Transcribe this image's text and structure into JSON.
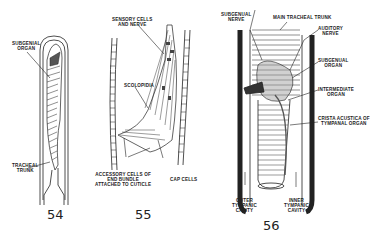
{
  "figures": [
    {
      "number": "54",
      "labels": {
        "subgenual_organ_1": "SUBGENIAL",
        "subgenual_organ_2": "ORGAN",
        "tracheal_trunk_1": "TRACHEAL",
        "tracheal_trunk_2": "TRUNK"
      }
    },
    {
      "number": "55",
      "labels": {
        "sensory_1": "SENSORY CELLS",
        "sensory_2": "AND NERVE",
        "scolopidia": "SCOLOPIDIA",
        "accessory_1": "ACCESSORY CELLS OF",
        "accessory_2": "END      BUNDLE",
        "accessory_3": "ATTACHED TO CUTICLE",
        "cap_cells": "CAP CELLS"
      }
    },
    {
      "number": "56",
      "labels": {
        "subgenual_nerve_1": "SUBGENUAL",
        "subgenual_nerve_2": "NERVE",
        "main_tracheal_trunk": "MAIN TRACHEAL TRUNK",
        "auditory_nerve_1": "AUDITORY",
        "auditory_nerve_2": "NERVE",
        "subgenual_organ_1": "SUBGENUAL",
        "subgenual_organ_2": "ORGAN",
        "intermediate_organ_1": "INTERMEDIATE",
        "intermediate_organ_2": "ORGAN",
        "crista_1": "CRISTA ACUSTICA OF",
        "crista_2": "TYMPANAL ORGAN",
        "outer_cavity_1": "OUTER",
        "outer_cavity_2": "TYMPANIC",
        "outer_cavity_3": "CAVITY",
        "inner_cavity_1": "INNER",
        "inner_cavity_2": "TYMPANIC",
        "inner_cavity_3": "CAVITY"
      }
    }
  ]
}
